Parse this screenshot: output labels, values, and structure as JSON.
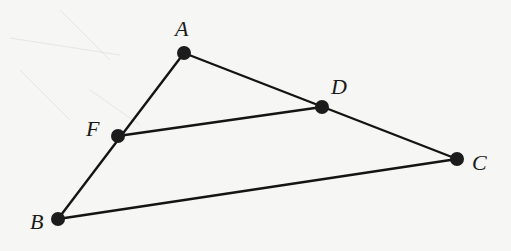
{
  "diagram": {
    "type": "triangle-with-midsegment",
    "background_color": "#f6f6f4",
    "stroke_color": "#141414",
    "point_color": "#1c1c1c",
    "points": {
      "A": {
        "label": "A",
        "x": 184,
        "y": 53
      },
      "B": {
        "label": "B",
        "x": 58,
        "y": 219
      },
      "C": {
        "label": "C",
        "x": 457,
        "y": 159
      },
      "D": {
        "label": "D",
        "x": 322,
        "y": 107
      },
      "F": {
        "label": "F",
        "x": 118,
        "y": 136
      }
    },
    "segments": [
      {
        "name": "AB",
        "from": "A",
        "to": "B",
        "via": "F"
      },
      {
        "name": "AC",
        "from": "A",
        "to": "C",
        "via": "D"
      },
      {
        "name": "BC",
        "from": "B",
        "to": "C"
      },
      {
        "name": "FD",
        "from": "F",
        "to": "D"
      }
    ],
    "labels": {
      "A": "A",
      "B": "B",
      "C": "C",
      "D": "D",
      "F": "F"
    }
  }
}
